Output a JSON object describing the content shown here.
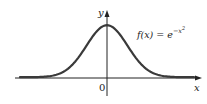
{
  "chart_data": {
    "type": "line",
    "title": "",
    "function_label": "f(x) = e^{-x^2}",
    "function_label_parts": {
      "lhs": "f(x) = e",
      "exponent": "−x",
      "exponent_power": "2"
    },
    "xlabel": "x",
    "ylabel": "y",
    "origin_label": "0",
    "xlim": [
      -3.1,
      3.1
    ],
    "ylim": [
      -0.3,
      1.3
    ],
    "grid": false,
    "legend": "none",
    "series": [
      {
        "name": "f(x) = e^{-x^2}",
        "x": [
          -3,
          -2.5,
          -2,
          -1.5,
          -1,
          -0.5,
          0,
          0.5,
          1,
          1.5,
          2,
          2.5,
          3
        ],
        "values": [
          0.0001,
          0.0019,
          0.0183,
          0.1054,
          0.3679,
          0.7788,
          1.0,
          0.7788,
          0.3679,
          0.1054,
          0.0183,
          0.0019,
          0.0001
        ]
      }
    ]
  },
  "colors": {
    "curve": "#3a3a3a",
    "axes": "#222222",
    "background": "#ffffff"
  }
}
